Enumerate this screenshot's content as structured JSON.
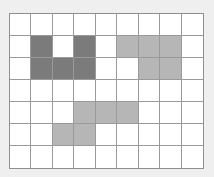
{
  "grid": {
    "rows": 7,
    "cols": 9,
    "colors": {
      "empty": "#ffffff",
      "dark": "#7b7b7b",
      "light": "#b6b6b6",
      "line": "#9a9a9a"
    },
    "cells": [
      [
        "empty",
        "empty",
        "empty",
        "empty",
        "empty",
        "empty",
        "empty",
        "empty",
        "empty"
      ],
      [
        "empty",
        "dark",
        "empty",
        "dark",
        "empty",
        "light",
        "light",
        "light",
        "empty"
      ],
      [
        "empty",
        "dark",
        "dark",
        "dark",
        "empty",
        "empty",
        "light",
        "light",
        "empty"
      ],
      [
        "empty",
        "empty",
        "empty",
        "empty",
        "empty",
        "empty",
        "empty",
        "empty",
        "empty"
      ],
      [
        "empty",
        "empty",
        "empty",
        "light",
        "light",
        "light",
        "empty",
        "empty",
        "empty"
      ],
      [
        "empty",
        "empty",
        "light",
        "light",
        "empty",
        "empty",
        "empty",
        "empty",
        "empty"
      ],
      [
        "empty",
        "empty",
        "empty",
        "empty",
        "empty",
        "empty",
        "empty",
        "empty",
        "empty"
      ]
    ]
  }
}
